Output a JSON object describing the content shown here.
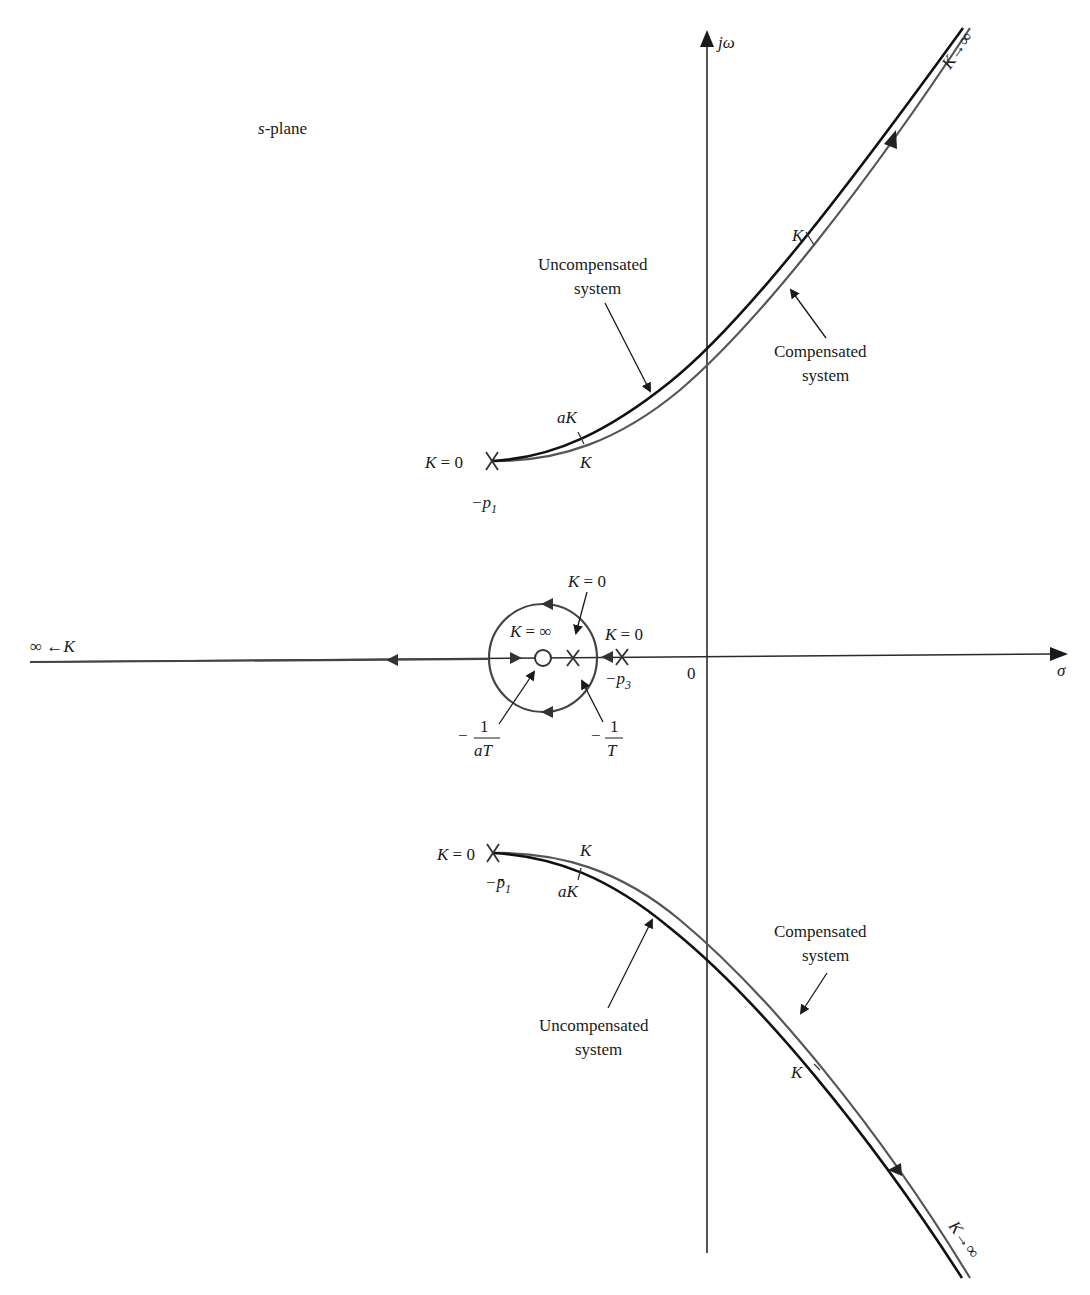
{
  "diagram": {
    "plane_label_prefix": "s",
    "plane_label_suffix": "-plane",
    "axes": {
      "imag_label": "jω",
      "real_label": "σ",
      "origin_label": "0"
    },
    "upper_branch": {
      "start_gain": "K = 0",
      "pole_label_base": "−p",
      "pole_label_sub": "1",
      "uncompensated_gain_mark": "aK",
      "compensated_gain_mark": "K",
      "upper_gain_mark": "K",
      "end_label": "K→∞",
      "uncompensated_label_line1": "Uncompensated",
      "uncompensated_label_line2": "system",
      "compensated_label_line1": "Compensated",
      "compensated_label_line2": "system"
    },
    "lower_branch": {
      "start_gain": "K = 0",
      "pole_label_base": "−p̄",
      "pole_label_sub": "1",
      "compensated_gain_mark": "K",
      "uncompensated_gain_mark": "aK",
      "lower_gain_mark": "K",
      "end_label": "K→∞",
      "uncompensated_label_line1": "Uncompensated",
      "uncompensated_label_line2": "system",
      "compensated_label_line1": "Compensated",
      "compensated_label_line2": "system"
    },
    "real_axis": {
      "left_end_label": "∞ ←K",
      "zero_gain_label": "K = ∞",
      "compensator_pole_gain": "K = 0",
      "pole3_gain": "K = 0",
      "pole3_label_base": "−p",
      "pole3_label_sub": "3",
      "zero_label_minus": "−",
      "zero_label_num": "1",
      "zero_label_den": "aT",
      "comp_pole_label_minus": "−",
      "comp_pole_label_num": "1",
      "comp_pole_label_den": "T"
    },
    "colors": {
      "uncompensated": "#111111",
      "compensated": "#555555",
      "axis": "#2a2a2a"
    }
  }
}
